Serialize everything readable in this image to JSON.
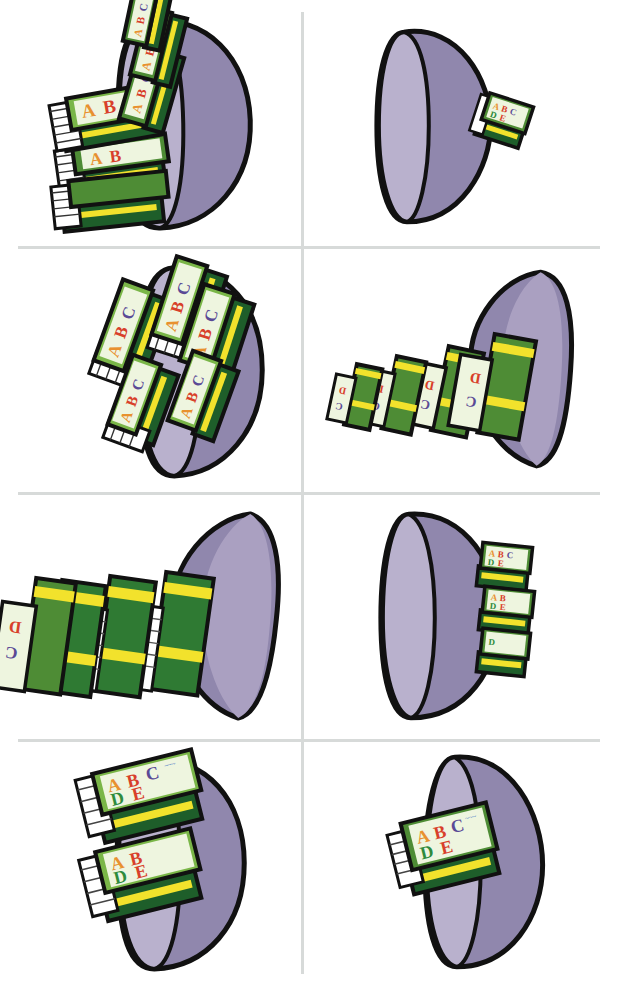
{
  "worksheet": {
    "title": "Many and Few - Books in Bowls",
    "description": "Eight panels, each showing a purple half-dome bowl with a quantity of green ABC books",
    "background_color": "#ffffff",
    "divider_color": "#d7dad9",
    "columns": 2,
    "rows": 4
  },
  "palette": {
    "bowl_outline": "#111111",
    "bowl_front_light": "#b9b1cd",
    "bowl_body_mid": "#aaa0c1",
    "bowl_interior_dark": "#9087ad",
    "book_cover_pale": "#e4f0cf",
    "book_cover_panel": "#eef5df",
    "book_green_light": "#7ab648",
    "book_green_mid": "#4e8c35",
    "book_green_dark": "#1e5e2a",
    "book_spine_band": "#f2e22c",
    "book_pages": "#ffffff",
    "letter_a": "#e8912f",
    "letter_b": "#d8402a",
    "letter_c": "#5a4a96",
    "letter_d": "#2f8b3c",
    "letter_e": "#d8402a",
    "letter_f": "#3d6fc4",
    "squiggle": "#3d6fc4"
  },
  "book_cover": {
    "line1": [
      "A",
      "B",
      "C"
    ],
    "line2": [
      "D",
      "E",
      "F"
    ],
    "squiggle_text": "~~~~"
  },
  "panels": [
    {
      "id": "panel-1",
      "position": "row1-col1",
      "bowl_orientation": "rim-right",
      "book_count": 6,
      "quantity_label": "many",
      "arrangement": "stacked-overflowing-left"
    },
    {
      "id": "panel-2",
      "position": "row1-col2",
      "bowl_orientation": "rim-left",
      "book_count": 1,
      "quantity_label": "few",
      "arrangement": "single-book-right-edge"
    },
    {
      "id": "panel-3",
      "position": "row2-col1",
      "bowl_orientation": "rim-right",
      "book_count": 5,
      "quantity_label": "many",
      "arrangement": "stacked-overflowing-left"
    },
    {
      "id": "panel-4",
      "position": "row2-col2",
      "bowl_orientation": "rim-left",
      "book_count": 4,
      "quantity_label": "few",
      "arrangement": "row-receding-left"
    },
    {
      "id": "panel-5",
      "position": "row3-col1",
      "bowl_orientation": "rim-left",
      "book_count": 4,
      "quantity_label": "many",
      "arrangement": "row-receding-left"
    },
    {
      "id": "panel-6",
      "position": "row3-col2",
      "bowl_orientation": "rim-left",
      "book_count": 3,
      "quantity_label": "few",
      "arrangement": "stacked-right-edge"
    },
    {
      "id": "panel-7",
      "position": "row4-col1",
      "bowl_orientation": "rim-right",
      "book_count": 2,
      "quantity_label": "many",
      "arrangement": "stacked-overflowing-left"
    },
    {
      "id": "panel-8",
      "position": "row4-col2",
      "bowl_orientation": "rim-left",
      "book_count": 1,
      "quantity_label": "few",
      "arrangement": "single-book-left-edge"
    }
  ]
}
